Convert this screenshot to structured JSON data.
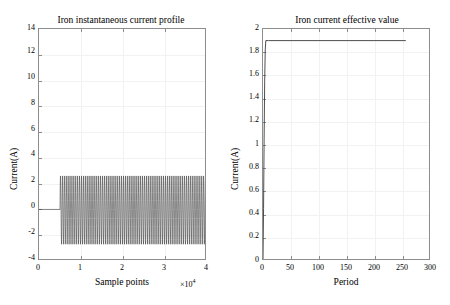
{
  "figure": {
    "width": 450,
    "height": 305,
    "background": "#ffffff",
    "line_color": "#3a3a3a",
    "axis_color": "#8d8d8d",
    "grid_color": "#f2f2f2"
  },
  "charts": [
    {
      "id": "iron-instantaneous-current-profile",
      "title": "Iron instantaneous current profile",
      "xlabel": "Sample points",
      "ylabel": "Current(A)",
      "x_exponent_prefix": "×10",
      "x_exponent_power": "4",
      "xticks": [
        "0",
        "1",
        "2",
        "3",
        "4"
      ],
      "yticks": [
        "-4",
        "-2",
        "0",
        "2",
        "4",
        "6",
        "8",
        "10",
        "12",
        "14"
      ]
    },
    {
      "id": "iron-current-effective-value",
      "title": "Iron current effective value",
      "xlabel": "Period",
      "ylabel": "Current(A)",
      "xticks": [
        "0",
        "50",
        "100",
        "150",
        "200",
        "250",
        "300"
      ],
      "yticks": [
        "0",
        "0.2",
        "0.4",
        "0.6",
        "0.8",
        "1",
        "1.2",
        "1.4",
        "1.6",
        "1.8",
        "2"
      ]
    }
  ],
  "chart_data": [
    {
      "type": "line",
      "title": "Iron instantaneous current profile",
      "xlabel": "Sample points",
      "ylabel": "Current(A)",
      "xlim": [
        0,
        40000
      ],
      "ylim": [
        -4,
        14
      ],
      "x_tick_values": [
        0,
        10000,
        20000,
        30000,
        40000
      ],
      "x_tick_labels": [
        "0",
        "1",
        "2",
        "3",
        "4"
      ],
      "x_axis_multiplier": 10000,
      "x_axis_multiplier_label": "×10^4",
      "y_tick_values": [
        -4,
        -2,
        0,
        2,
        4,
        6,
        8,
        10,
        12,
        14
      ],
      "y_tick_labels": [
        "-4",
        "-2",
        "0",
        "2",
        "4",
        "6",
        "8",
        "10",
        "12",
        "14"
      ],
      "grid": true,
      "legend": false,
      "series": [
        {
          "name": "iron instantaneous current",
          "description": "Flat at 0 A until sample ~5000, then a steady sinusoidal oscillation of roughly 2.6 A peak amplitude (about -2.7 A to +2.6 A) continuing to sample 40000.",
          "quiet_segment": {
            "x_start": 0,
            "x_end": 5000,
            "value": 0
          },
          "oscillation": {
            "x_start": 5000,
            "x_end": 40000,
            "amplitude_positive": 2.6,
            "amplitude_negative": -2.7,
            "cycles": 70,
            "period_samples": 500
          }
        }
      ]
    },
    {
      "type": "line",
      "title": "Iron current effective value",
      "xlabel": "Period",
      "ylabel": "Current(A)",
      "xlim": [
        0,
        300
      ],
      "ylim": [
        0,
        2
      ],
      "x_tick_values": [
        0,
        50,
        100,
        150,
        200,
        250,
        300
      ],
      "x_tick_labels": [
        "0",
        "50",
        "100",
        "150",
        "200",
        "250",
        "300"
      ],
      "y_tick_values": [
        0,
        0.2,
        0.4,
        0.6,
        0.8,
        1.0,
        1.2,
        1.4,
        1.6,
        1.8,
        2.0
      ],
      "y_tick_labels": [
        "0",
        "0.2",
        "0.4",
        "0.6",
        "0.8",
        "1",
        "1.2",
        "1.4",
        "1.6",
        "1.8",
        "2"
      ],
      "grid": true,
      "legend": false,
      "series": [
        {
          "name": "iron current RMS",
          "description": "Rises almost vertically from 0 A at period 0 to about 1.9 A by period 5, then holds constant at 1.9 A through period 255 where the trace ends.",
          "x": [
            0,
            1,
            2,
            3,
            4,
            5,
            10,
            25,
            50,
            75,
            100,
            125,
            150,
            175,
            200,
            225,
            250,
            255
          ],
          "y": [
            0,
            0.45,
            1.05,
            1.55,
            1.82,
            1.9,
            1.9,
            1.9,
            1.9,
            1.9,
            1.9,
            1.9,
            1.9,
            1.9,
            1.9,
            1.9,
            1.9,
            1.9
          ],
          "steady_value": 1.9,
          "x_end": 255
        }
      ]
    }
  ]
}
